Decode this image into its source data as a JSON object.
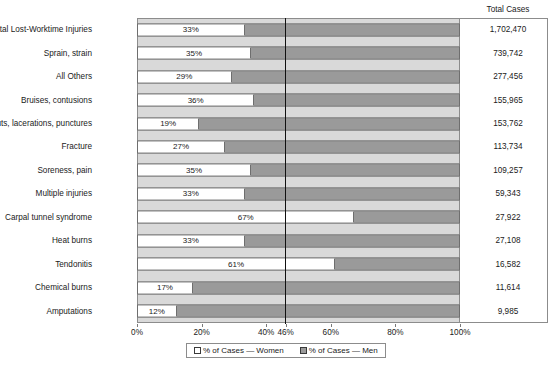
{
  "chart_data": {
    "type": "bar",
    "orientation": "horizontal",
    "stacked": true,
    "title": "",
    "xlabel": "",
    "ylabel": "",
    "xlim": [
      0,
      100
    ],
    "grid": false,
    "legend_position": "bottom",
    "categories": [
      "Total Lost-Worktime Injuries",
      "Sprain, strain",
      "All Others",
      "Bruises, contusions",
      "Cuts, lacerations, punctures",
      "Fracture",
      "Soreness, pain",
      "Multiple injuries",
      "Carpal tunnel syndrome",
      "Heat burns",
      "Tendonitis",
      "Chemical burns",
      "Amputations"
    ],
    "series": [
      {
        "name": "% of Cases — Women",
        "values": [
          33,
          35,
          29,
          36,
          19,
          27,
          35,
          33,
          67,
          33,
          61,
          17,
          12
        ]
      },
      {
        "name": "% of Cases — Men",
        "values": [
          67,
          65,
          71,
          64,
          81,
          73,
          65,
          67,
          33,
          67,
          39,
          83,
          88
        ]
      }
    ],
    "data_labels": [
      "33%",
      "35%",
      "29%",
      "36%",
      "19%",
      "27%",
      "35%",
      "33%",
      "67%",
      "33%",
      "61%",
      "17%",
      "12%"
    ],
    "total_cases_header": "Total Cases",
    "total_cases": [
      "1,702,470",
      "739,742",
      "277,456",
      "155,965",
      "153,762",
      "113,734",
      "109,257",
      "59,343",
      "27,922",
      "27,108",
      "16,582",
      "11,614",
      "9,985"
    ],
    "xticks": [
      {
        "value": 0,
        "label": "0%"
      },
      {
        "value": 20,
        "label": "20%"
      },
      {
        "value": 40,
        "label": "40%"
      },
      {
        "value": 46,
        "label": "46%"
      },
      {
        "value": 60,
        "label": "60%"
      },
      {
        "value": 80,
        "label": "80%"
      },
      {
        "value": 100,
        "label": "100%"
      }
    ],
    "reference_line": {
      "value": 46,
      "label": "46%"
    },
    "legend": [
      {
        "label": "% of Cases — Women",
        "swatch": "women",
        "color": "#ffffff"
      },
      {
        "label": "% of Cases — Men",
        "swatch": "men",
        "color": "#9a9a9a"
      }
    ],
    "colors": {
      "women": "#ffffff",
      "men": "#9a9a9a",
      "plot_background": "#d9d9d9",
      "reference_line": "#111111",
      "border": "#6e6e6e"
    }
  }
}
